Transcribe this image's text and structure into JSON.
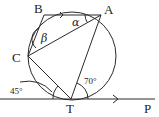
{
  "diagram": {
    "type": "circle-geometry",
    "points": {
      "A": "A",
      "B": "B",
      "C": "C",
      "T": "T",
      "P": "P"
    },
    "angles": {
      "alpha": "α",
      "beta": "β",
      "angle_CT_tangent": "45°",
      "angle_AT_tangent": "70°"
    },
    "notes": {
      "BA_parallel_to_TP": true,
      "TP_is_tangent_at_T": true
    }
  }
}
